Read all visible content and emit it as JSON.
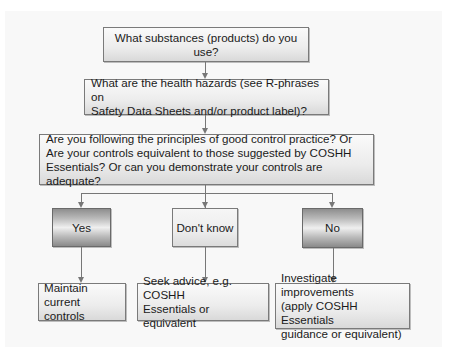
{
  "flowchart": {
    "q1": "What substances (products) do you use?",
    "q2": {
      "line1": "What are the health hazards (see R-phrases on",
      "line2": "Safety Data Sheets and/or product label)?"
    },
    "q3": {
      "line1": "Are you following the principles of good control practice? Or",
      "line2": "Are your controls equivalent to those suggested by COSHH",
      "line3": "Essentials? Or can you demonstrate your controls are adequate?"
    },
    "answers": {
      "yes": "Yes",
      "dont_know": "Don't know",
      "no": "No"
    },
    "actions": {
      "yes": {
        "line1": "Maintain current",
        "line2": "controls"
      },
      "dont_know": {
        "line1": "Seek advice, e.g. COSHH",
        "line2": "Essentials or equivalent"
      },
      "no": {
        "line1": "Investigate improvements",
        "line2": "(apply COSHH Essentials",
        "line3": "guidance or equivalent)"
      }
    }
  },
  "colors": {
    "line": "#777777",
    "border": "#7a7a7a",
    "dark_box_edge": "#8a8a8a",
    "light_box": "#f0f0f0"
  }
}
